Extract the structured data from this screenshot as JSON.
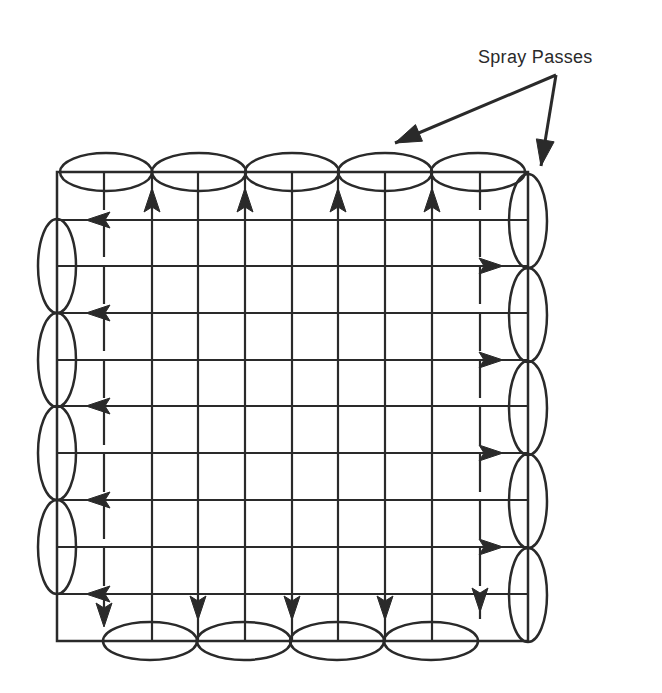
{
  "diagram": {
    "title_label": "Spray Passes",
    "colors": {
      "ink": "#2a2a2a",
      "background": "#ffffff"
    },
    "frame": {
      "left": 57,
      "top": 172,
      "right": 528,
      "bottom": 641
    },
    "grid": {
      "vertical_x": [
        104,
        152,
        198,
        245,
        292,
        338,
        385,
        432,
        480
      ],
      "horizontal_y": [
        220,
        266,
        313,
        360,
        406,
        453,
        500,
        547,
        594
      ]
    },
    "spray_passes": {
      "top": [
        {
          "cx": 106,
          "cy": 172,
          "rx": 46,
          "ry": 19
        },
        {
          "cx": 199,
          "cy": 172,
          "rx": 47,
          "ry": 19
        },
        {
          "cx": 292,
          "cy": 172,
          "rx": 47,
          "ry": 19
        },
        {
          "cx": 385,
          "cy": 172,
          "rx": 47,
          "ry": 19
        },
        {
          "cx": 478,
          "cy": 172,
          "rx": 47,
          "ry": 19
        }
      ],
      "left": [
        {
          "cx": 57,
          "cy": 266,
          "rx": 19,
          "ry": 47
        },
        {
          "cx": 57,
          "cy": 360,
          "rx": 19,
          "ry": 47
        },
        {
          "cx": 57,
          "cy": 453,
          "rx": 19,
          "ry": 47
        },
        {
          "cx": 57,
          "cy": 547,
          "rx": 19,
          "ry": 47
        }
      ],
      "right": [
        {
          "cx": 528,
          "cy": 221,
          "rx": 19,
          "ry": 47
        },
        {
          "cx": 528,
          "cy": 315,
          "rx": 19,
          "ry": 47
        },
        {
          "cx": 528,
          "cy": 408,
          "rx": 19,
          "ry": 47
        },
        {
          "cx": 528,
          "cy": 501,
          "rx": 19,
          "ry": 47
        },
        {
          "cx": 528,
          "cy": 595,
          "rx": 19,
          "ry": 47
        }
      ],
      "bottom": [
        {
          "cx": 150,
          "cy": 641,
          "rx": 47,
          "ry": 19
        },
        {
          "cx": 244,
          "cy": 641,
          "rx": 47,
          "ry": 19
        },
        {
          "cx": 337,
          "cy": 641,
          "rx": 47,
          "ry": 19
        },
        {
          "cx": 431,
          "cy": 641,
          "rx": 47,
          "ry": 19
        }
      ]
    },
    "flow_arrows": {
      "up": [
        152,
        245,
        338,
        432
      ],
      "down": [
        198,
        292,
        385
      ],
      "left_rows": [
        220,
        313,
        406,
        500,
        594
      ],
      "right_rows": [
        266,
        360,
        453,
        547
      ]
    },
    "callout": {
      "origin": {
        "x": 556,
        "y": 75
      },
      "targets": [
        {
          "x": 395,
          "y": 143
        },
        {
          "x": 541,
          "y": 166
        }
      ]
    }
  }
}
